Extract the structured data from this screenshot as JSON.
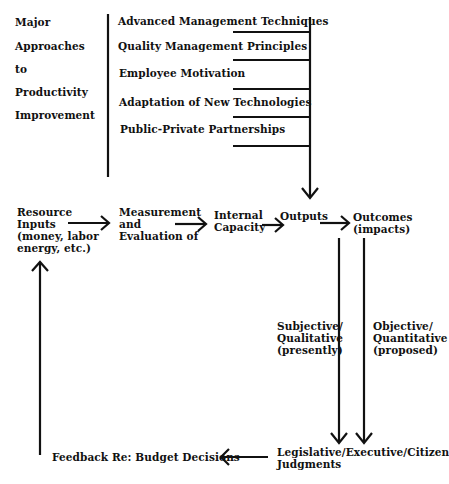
{
  "left_heading": {
    "lines": [
      "Major",
      "Approaches",
      "to",
      "Productivity",
      "Improvement"
    ]
  },
  "approaches": [
    "Advanced Management Techniques",
    "Quality Management Principles",
    "Employee Motivation",
    "Adaptation of New Technologies",
    "Public-Private Partnerships"
  ],
  "flow": {
    "resource_inputs": "Resource\nInputs\n(money, labor\nenergy, etc.)",
    "measurement": "Measurement\nand\nEvaluation of",
    "internal_capacity": "Internal\nCapacity",
    "outputs": "Outputs",
    "outcomes": "Outcomes\n(impacts)"
  },
  "evaluation": {
    "subjective": "Subjective/\nQualitative\n(presently)",
    "objective": "Objective/\nQuantitative\n(proposed)"
  },
  "bottom": {
    "feedback": "Feedback Re:  Budget Decisions",
    "judgments": "Legislative/Executive/Citizen\nJudgments"
  },
  "colors": {
    "ink": "#111111",
    "background": "#ffffff"
  }
}
